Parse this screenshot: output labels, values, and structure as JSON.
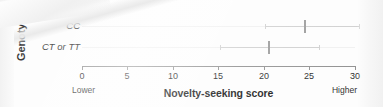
{
  "chart_data": {
    "type": "scatter",
    "title": "",
    "xlabel": "Novelty-seeking score",
    "ylabel": "Genotype",
    "xlim": [
      0,
      30
    ],
    "ylim": [
      0,
      2
    ],
    "grid": false,
    "legend": null,
    "orientation": "horizontal",
    "xticks": [
      0,
      5,
      10,
      15,
      20,
      25,
      30
    ],
    "xticklabels": [
      "0",
      "5",
      "10",
      "15",
      "20",
      "25",
      "30"
    ],
    "x_axis_end_labels": {
      "left": "Lower",
      "right": "Higher"
    },
    "categories": [
      "CC",
      "CT or TT"
    ],
    "values": [
      24.5,
      20.5
    ],
    "series": [
      {
        "name": "Novelty-seeking score",
        "points": [
          {
            "category": "CC",
            "value": 24.5,
            "ci_low": 20.1,
            "ci_high": 30.4
          },
          {
            "category": "CT or TT",
            "value": 20.5,
            "ci_low": 15.2,
            "ci_high": 26.0
          }
        ]
      }
    ],
    "colors": {
      "point": "#9a9a9a",
      "error_bar": "#cfcfcf",
      "axis": "#8f8f8f",
      "text": "#1d1d1d",
      "background": "#fdfdfd"
    }
  },
  "axis": {
    "y_title": "Genotype",
    "x_title": "Novelty-seeking score",
    "left_end": "Lower",
    "right_end": "Higher"
  },
  "categories": {
    "cc": "CC",
    "ct_or_tt": "CT or TT"
  },
  "ticks": {
    "t0": "0",
    "t5": "5",
    "t10": "10",
    "t15": "15",
    "t20": "20",
    "t25": "25",
    "t30": "30"
  }
}
